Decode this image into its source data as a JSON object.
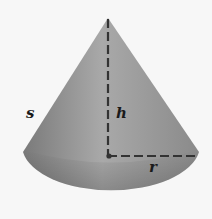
{
  "diagram": {
    "shape": "cone",
    "labels": {
      "slant_height": "s",
      "height": "h",
      "radius": "r"
    },
    "colors": {
      "background": "#f7f7f7",
      "cone_light": "#a8a8a8",
      "cone_dark": "#6e6e6e",
      "dashes": "#333333"
    }
  }
}
